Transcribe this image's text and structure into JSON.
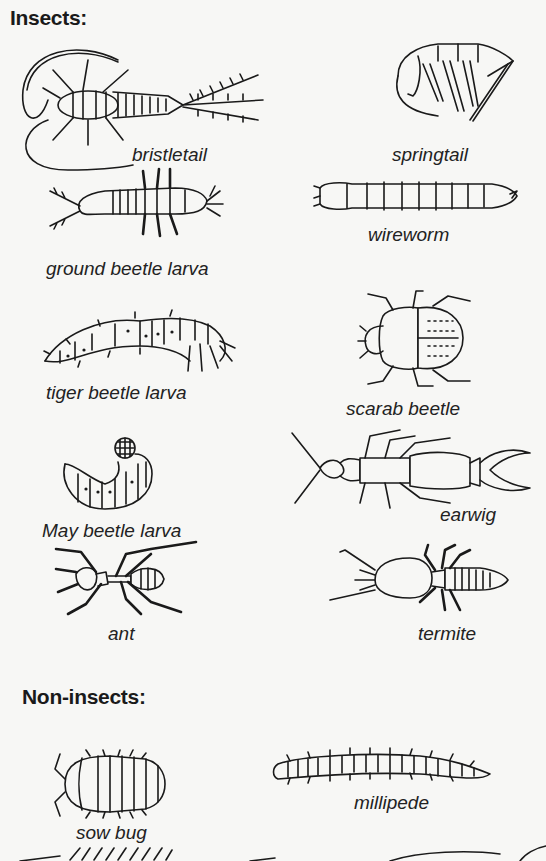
{
  "sections": [
    {
      "heading": "Insects:",
      "organisms": [
        {
          "name": "bristletail",
          "icon": "bristletail-icon"
        },
        {
          "name": "springtail",
          "icon": "springtail-icon"
        },
        {
          "name": "ground beetle larva",
          "icon": "ground-beetle-larva-icon"
        },
        {
          "name": "wireworm",
          "icon": "wireworm-icon"
        },
        {
          "name": "tiger beetle larva",
          "icon": "tiger-beetle-larva-icon"
        },
        {
          "name": "scarab beetle",
          "icon": "scarab-beetle-icon"
        },
        {
          "name": "May beetle larva",
          "icon": "may-beetle-larva-icon"
        },
        {
          "name": "earwig",
          "icon": "earwig-icon"
        },
        {
          "name": "ant",
          "icon": "ant-icon"
        },
        {
          "name": "termite",
          "icon": "termite-icon"
        }
      ]
    },
    {
      "heading": "Non-insects:",
      "organisms": [
        {
          "name": "sow bug",
          "icon": "sow-bug-icon"
        },
        {
          "name": "millipede",
          "icon": "millipede-icon"
        }
      ]
    }
  ]
}
